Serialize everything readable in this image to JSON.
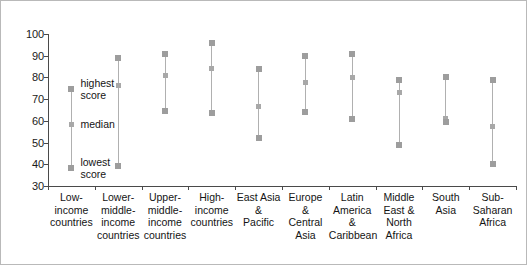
{
  "chart_data": {
    "type": "scatter",
    "title": "",
    "xlabel": "",
    "ylabel": "",
    "ylim": [
      30,
      100
    ],
    "ytick_labels": [
      "100",
      "90",
      "80",
      "70",
      "60",
      "50",
      "40",
      "30"
    ],
    "yticks": [
      100,
      90,
      80,
      70,
      60,
      50,
      40,
      30
    ],
    "grid": false,
    "legend": "none",
    "series_names": [
      "highest score",
      "median",
      "lowest score"
    ],
    "categories": [
      "Low-income countries",
      "Lower-middle-income countries",
      "Upper-middle-income countries",
      "High-income countries",
      "East Asia & Pacific",
      "Europe & Central Asia",
      "Latin America & Caribbean",
      "Middle East & North Africa",
      "South Asia",
      "Sub-Saharan Africa"
    ],
    "category_label_lines": [
      [
        "Low-",
        "income",
        "countries"
      ],
      [
        "Lower-",
        "middle-",
        "income",
        "countries"
      ],
      [
        "Upper-",
        "middle-",
        "income",
        "countries"
      ],
      [
        "High-",
        "income",
        "countries"
      ],
      [
        "East Asia",
        "&",
        "Pacific"
      ],
      [
        "Europe",
        "&",
        "Central",
        "Asia"
      ],
      [
        "Latin",
        "America",
        "&",
        "Caribbean"
      ],
      [
        "Middle",
        "East &",
        "North",
        "Africa"
      ],
      [
        "South",
        "Asia"
      ],
      [
        "Sub-Saharan",
        "Africa"
      ]
    ],
    "series": [
      {
        "name": "highest score",
        "values": [
          74.5,
          89,
          91,
          96,
          84,
          90,
          91,
          79,
          80,
          79
        ]
      },
      {
        "name": "median",
        "values": [
          58.5,
          76.5,
          81,
          84,
          66.5,
          77.5,
          80,
          73,
          61,
          57.5
        ]
      },
      {
        "name": "lowest score",
        "values": [
          38.5,
          39,
          64.5,
          63.5,
          52,
          64,
          61,
          49,
          59.5,
          40
        ]
      }
    ],
    "annotations": [
      {
        "id": "highest-score",
        "lines": [
          "highest",
          "score"
        ],
        "value": 74.5
      },
      {
        "id": "median",
        "lines": [
          "median"
        ],
        "value": 58.5
      },
      {
        "id": "lowest-score",
        "lines": [
          "lowest",
          "score"
        ],
        "value": 38.5
      }
    ],
    "colors": {
      "marker": "#9d9d9d",
      "line": "#b0b0b0",
      "axis": "#4a4a4a",
      "text": "#141414",
      "frame": "#b9b9b9",
      "background": "#ffffff"
    }
  }
}
